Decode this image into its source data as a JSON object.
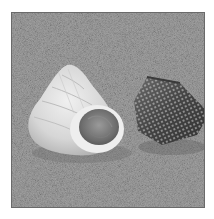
{
  "image": {
    "subject": "Two seashells on sand",
    "description": "Grayscale photograph of a pale spiral turban shell with its round aperture facing the viewer, beside a dark conical top shell covered in rows of light dots, both resting on fine-grained sand.",
    "colors": {
      "background": "#ffffff",
      "frame": "#6a6a6a",
      "sand": "#9d9d9d",
      "light_shell": "#dcdcdc",
      "dark_shell": "#4a4a4a"
    },
    "elements": [
      {
        "name": "light-turban-shell",
        "position": "left-center"
      },
      {
        "name": "shell-aperture",
        "position": "center"
      },
      {
        "name": "dark-dotted-top-shell",
        "position": "right-center"
      },
      {
        "name": "sand-background",
        "position": "full"
      }
    ]
  }
}
